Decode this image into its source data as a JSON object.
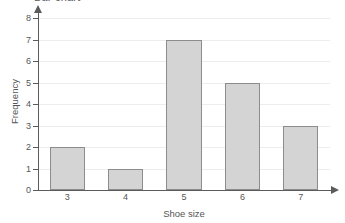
{
  "chart_data": {
    "type": "bar",
    "title": "Bar chart",
    "categories": [
      "3",
      "4",
      "5",
      "6",
      "7"
    ],
    "values": [
      2,
      1,
      7,
      5,
      3
    ],
    "xlabel": "Shoe size",
    "ylabel": "Frequency",
    "ylim": [
      0,
      8
    ],
    "ytick_labels": [
      "0",
      "1",
      "2",
      "3",
      "4",
      "5",
      "6",
      "7",
      "8"
    ],
    "ytick_values": [
      0,
      1,
      2,
      3,
      4,
      5,
      6,
      7,
      8
    ],
    "grid": "horizontal",
    "legend": null,
    "series": [
      {
        "name": "Frequency",
        "values": [
          2,
          1,
          7,
          5,
          3
        ]
      }
    ],
    "colors": {
      "bar_fill": "#d4d4d4",
      "bar_border": "#8c8c8c",
      "gridline": "#ededed",
      "axis": "#5b5b5b",
      "text": "#555555",
      "background": "#ffffff"
    }
  }
}
